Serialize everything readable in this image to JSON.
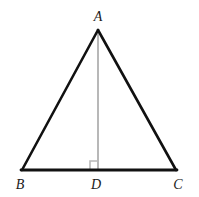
{
  "figure": {
    "kind": "geometry-diagram",
    "background_color": "#ffffff",
    "stroke_color": "#111111",
    "altitude_color": "#b8b8b8",
    "right_angle_color": "#b8b8b8",
    "label_color": "#1a1a1a",
    "side_stroke_width": 2.6,
    "base_stroke_width": 2.8,
    "altitude_stroke_width": 2.0,
    "right_angle_stroke_width": 1.6,
    "right_angle_size": 8
  },
  "points": {
    "A": {
      "label": "A",
      "x": 98,
      "y": 30,
      "label_x": 98,
      "label_y": 21
    },
    "B": {
      "label": "B",
      "x": 22,
      "y": 170,
      "label_x": 20,
      "label_y": 189
    },
    "C": {
      "label": "C",
      "x": 176,
      "y": 170,
      "label_x": 178,
      "label_y": 189
    },
    "D": {
      "label": "D",
      "x": 98,
      "y": 170,
      "label_x": 96,
      "label_y": 189
    }
  },
  "segments": [
    {
      "name": "side-AB",
      "from": "B",
      "to": "A",
      "color": "#111111",
      "width": 2.6
    },
    {
      "name": "side-AC",
      "from": "A",
      "to": "C",
      "color": "#111111",
      "width": 2.6
    },
    {
      "name": "base-BC",
      "from": "B",
      "to": "C",
      "color": "#111111",
      "width": 2.8
    },
    {
      "name": "altitude-AD",
      "from": "A",
      "to": "D",
      "color": "#b8b8b8",
      "width": 2.0
    }
  ],
  "markers": {
    "right_angle_at_D": {
      "name": "right-angle-marker",
      "vertex": "D",
      "opens_toward": "upper-left",
      "size": 8,
      "color": "#b8b8b8"
    }
  }
}
